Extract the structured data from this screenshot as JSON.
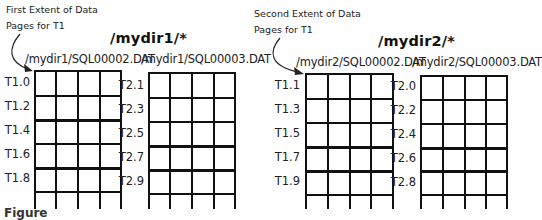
{
  "left": {
    "note_line1": "First Extent of Data",
    "note_line2": "Pages for T1",
    "dir_title": "/mydir1/*",
    "files": [
      {
        "name": "/mydir1/SQL00002.DAT",
        "labels": [
          "T1.0",
          "T1.2",
          "T1.4",
          "T1.6",
          "T1.8"
        ]
      },
      {
        "name": "/mydir1/SQL00003.DAT",
        "labels": [
          "T2.1",
          "T2.3",
          "T2.5",
          "T2.7",
          "T2.9"
        ]
      }
    ]
  },
  "right": {
    "note_line1": "Second Extent of Data",
    "note_line2": "Pages for T1",
    "dir_title": "/mydir2/*",
    "files": [
      {
        "name": "/mydir2/SQL00002.DAT",
        "labels": [
          "T1.1",
          "T1.3",
          "T1.5",
          "T1.7",
          "T1.9"
        ]
      },
      {
        "name": "/mydir2/SQL00003.DAT",
        "labels": [
          "T2.0",
          "T2.2",
          "T2.4",
          "T2.6",
          "T2.8"
        ]
      }
    ]
  },
  "caption": "Figure",
  "colors": {
    "line": "#111111",
    "background": "#ffffff"
  }
}
